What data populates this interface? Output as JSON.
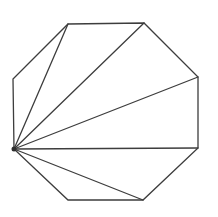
{
  "figure": {
    "canvas": {
      "width": 218,
      "height": 217,
      "background_color": "#ffffff"
    },
    "stroke": {
      "color": "#3d3d3d",
      "width": 1.3
    },
    "octagon_vertices": [
      {
        "name": "top-left",
        "x": 68,
        "y": 24
      },
      {
        "name": "top-right",
        "x": 144,
        "y": 23
      },
      {
        "name": "right-top",
        "x": 198,
        "y": 77
      },
      {
        "name": "right-bottom",
        "x": 198,
        "y": 148
      },
      {
        "name": "bottom-right",
        "x": 143,
        "y": 200
      },
      {
        "name": "bottom-left",
        "x": 68,
        "y": 200
      },
      {
        "name": "left-bottom",
        "x": 14,
        "y": 149
      },
      {
        "name": "left-top",
        "x": 13,
        "y": 79
      }
    ],
    "fan_vertex": {
      "name": "left-bottom",
      "dot_radius": 2.5,
      "dot_color": "#2e2e2e"
    },
    "diagonals": [
      {
        "from": "left-bottom",
        "to": "top-left"
      },
      {
        "from": "left-bottom",
        "to": "top-right"
      },
      {
        "from": "left-bottom",
        "to": "right-top"
      },
      {
        "from": "left-bottom",
        "to": "right-bottom"
      },
      {
        "from": "left-bottom",
        "to": "bottom-right"
      }
    ]
  }
}
